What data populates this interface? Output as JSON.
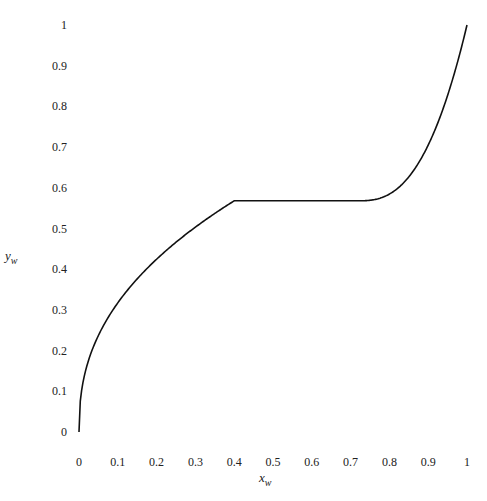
{
  "chart_data": {
    "type": "line",
    "title": "",
    "xlabel": "x_w",
    "ylabel": "y_w",
    "xlim": [
      0,
      1
    ],
    "ylim": [
      0,
      1
    ],
    "grid": false,
    "legend": null,
    "x_ticks": [
      "0",
      "0.1",
      "0.2",
      "0.3",
      "0.4",
      "0.5",
      "0.6",
      "0.7",
      "0.8",
      "0.9",
      "1"
    ],
    "y_ticks": [
      "0",
      "0.1",
      "0.2",
      "0.3",
      "0.4",
      "0.5",
      "0.6",
      "0.7",
      "0.8",
      "0.9",
      "1"
    ],
    "series": [
      {
        "name": "curve",
        "color": "#111111",
        "x": [
          0,
          0.005,
          0.02,
          0.05,
          0.1,
          0.15,
          0.2,
          0.25,
          0.3,
          0.35,
          0.4,
          0.5,
          0.6,
          0.7,
          0.72,
          0.75,
          0.8,
          0.85,
          0.9,
          0.95,
          0.98,
          1.0
        ],
        "y": [
          0,
          0.12,
          0.2,
          0.28,
          0.36,
          0.42,
          0.465,
          0.5,
          0.53,
          0.55,
          0.568,
          0.568,
          0.568,
          0.568,
          0.568,
          0.585,
          0.62,
          0.67,
          0.74,
          0.83,
          0.91,
          1.0
        ]
      }
    ],
    "annotations": [
      "Flat plateau at y_w ≈ 0.57 between x_w ≈ 0.40 and x_w ≈ 0.72"
    ]
  },
  "axis": {
    "xlabel_main": "x",
    "xlabel_sub": "w",
    "ylabel_main": "y",
    "ylabel_sub": "w"
  }
}
